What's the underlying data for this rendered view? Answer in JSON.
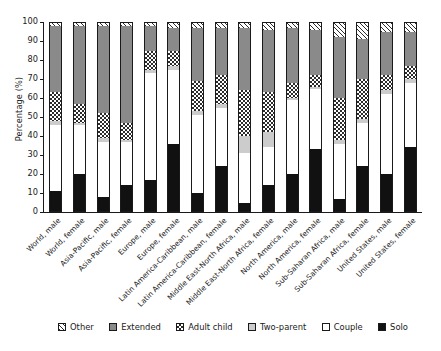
{
  "chart_data": {
    "type": "bar",
    "subtype": "stacked-bar-100-percent",
    "title": "",
    "xlabel": "",
    "ylabel": "Percentage (%)",
    "ylim": [
      0,
      100
    ],
    "yticks": [
      0,
      10,
      20,
      30,
      40,
      50,
      60,
      70,
      80,
      90,
      100
    ],
    "grid": false,
    "legend_position": "bottom",
    "stack_order_bottom_to_top": [
      "Solo",
      "Couple",
      "Adult child",
      "Extended",
      "Two-parent",
      "Other"
    ],
    "categories": [
      "World, male",
      "World, female",
      "Asia-Pacific, male",
      "Asia-Pacific, female",
      "Europe, male",
      "Europe, female",
      "Latin America-Caribbean, male",
      "Latin America-Caribbean, female",
      "Middle East-North Africa, male",
      "Middle East-North Africa, female",
      "North America, male",
      "North America, female",
      "Sub-Saharan Africa, male",
      "Sub-Saharan Africa, female",
      "United States, male",
      "United States, female"
    ],
    "series": [
      {
        "name": "Solo",
        "values": [
          11,
          20,
          8,
          14,
          17,
          36,
          10,
          24,
          5,
          14,
          20,
          33,
          7,
          24,
          20,
          34
        ]
      },
      {
        "name": "Couple",
        "values": [
          35,
          26,
          29,
          23,
          56,
          39,
          41,
          31,
          26,
          20,
          39,
          32,
          29,
          23,
          42,
          34
        ]
      },
      {
        "name": "Adult child",
        "values": [
          2,
          1,
          2,
          1,
          2,
          2,
          2,
          2,
          9,
          8,
          1,
          1,
          2,
          2,
          2,
          2
        ]
      },
      {
        "name": "Extended",
        "values": [
          15,
          10,
          13,
          9,
          10,
          8,
          16,
          15,
          24,
          21,
          8,
          6,
          22,
          21,
          8,
          7
        ]
      },
      {
        "name": "Two-parent",
        "values": [
          35,
          41,
          46,
          51,
          13,
          12,
          28,
          25,
          33,
          33,
          29,
          24,
          32,
          21,
          23,
          18
        ]
      },
      {
        "name": "Other",
        "values": [
          2,
          2,
          2,
          2,
          2,
          3,
          3,
          3,
          3,
          4,
          3,
          4,
          8,
          9,
          5,
          5
        ]
      }
    ]
  },
  "legend": {
    "items": [
      {
        "label": "Other",
        "pattern": "p-other"
      },
      {
        "label": "Extended",
        "pattern": "p-twoparent"
      },
      {
        "label": "Adult child",
        "pattern": "p-extended"
      },
      {
        "label": "Two-parent",
        "pattern": "p-adultchild"
      },
      {
        "label": "Couple",
        "pattern": "p-couple"
      },
      {
        "label": "Solo",
        "pattern": "p-solo"
      }
    ]
  },
  "style": {
    "ink": "#1a1a1a",
    "two_parent_fill": "#8a8a8a",
    "adult_child_fill": "#cccccc",
    "solo_fill": "#111111",
    "background": "#ffffff"
  }
}
